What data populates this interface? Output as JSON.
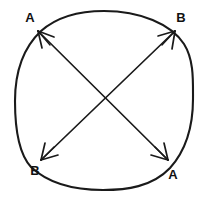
{
  "figure": {
    "type": "geometry-diagram",
    "background_color": "#ffffff",
    "stroke_color": "#1a1a1a",
    "text_color": "#111111",
    "canvas": {
      "width": 207,
      "height": 199
    }
  },
  "circle": {
    "name": "hand-drawn-circle",
    "center": {
      "x": 104,
      "y": 100
    },
    "radius_x": 89,
    "radius_y": 90,
    "extents": {
      "left": 15,
      "right": 193,
      "top": 11,
      "bottom": 190
    },
    "stroke_width": 2.1,
    "filled": false
  },
  "chords": [
    {
      "name": "chord-topleft-bottomright",
      "from": {
        "x": 38,
        "y": 31
      },
      "to": {
        "x": 168,
        "y": 160
      },
      "double_headed": true,
      "start_label": "A",
      "end_label": "A"
    },
    {
      "name": "chord-topright-bottomleft",
      "from": {
        "x": 175,
        "y": 31
      },
      "to": {
        "x": 41,
        "y": 160
      },
      "double_headed": true,
      "start_label": "B",
      "end_label": "B"
    }
  ],
  "intersection": {
    "x": 105,
    "y": 98
  },
  "labels": [
    {
      "id": "label-top-left",
      "text": "A",
      "x": 30,
      "y": 22,
      "anchor": "middle",
      "position": "top-left"
    },
    {
      "id": "label-top-right",
      "text": "B",
      "x": 181,
      "y": 22,
      "anchor": "middle",
      "position": "top-right"
    },
    {
      "id": "label-bottom-left",
      "text": "B",
      "x": 35,
      "y": 175,
      "anchor": "middle",
      "position": "bottom-left"
    },
    {
      "id": "label-bottom-right",
      "text": "A",
      "x": 173,
      "y": 179,
      "anchor": "middle",
      "position": "bottom-right"
    }
  ]
}
